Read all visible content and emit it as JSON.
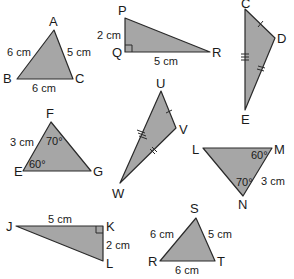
{
  "colors": {
    "fill": "#a6a6a6",
    "stroke": "#2a2a2a",
    "text": "#1a1a1a",
    "background": "#ffffff"
  },
  "triangles": {
    "abc": {
      "vertices": {
        "A": "A",
        "B": "B",
        "C": "C"
      },
      "sides": {
        "ab": "6 cm",
        "ac": "5 cm",
        "bc": "6 cm"
      }
    },
    "pqr": {
      "vertices": {
        "P": "P",
        "Q": "Q",
        "R": "R"
      },
      "sides": {
        "pq": "2 cm",
        "qr": "5 cm"
      },
      "right_angle_at": "Q"
    },
    "cde": {
      "vertices": {
        "C": "C",
        "D": "D",
        "E": "E"
      },
      "tick_marks": {
        "cd": 1,
        "de": 2,
        "ce": 3
      }
    },
    "efg": {
      "vertices": {
        "E": "E",
        "F": "F",
        "G": "G"
      },
      "sides": {
        "ef": "3 cm"
      },
      "angles": {
        "F": "70°",
        "E": "60°"
      }
    },
    "uvw": {
      "vertices": {
        "U": "U",
        "V": "V",
        "W": "W"
      },
      "tick_marks": {
        "uv": 1,
        "vw": 2,
        "uw": 3
      }
    },
    "lmn": {
      "vertices": {
        "L": "L",
        "M": "M",
        "N": "N"
      },
      "sides": {
        "mn": "3 cm"
      },
      "angles": {
        "M": "60°",
        "N": "70°"
      }
    },
    "jkl": {
      "vertices": {
        "J": "J",
        "K": "K",
        "L": "L"
      },
      "sides": {
        "jk": "5 cm",
        "kl": "2 cm"
      },
      "right_angle_at": "K"
    },
    "rst": {
      "vertices": {
        "R": "R",
        "S": "S",
        "T": "T"
      },
      "sides": {
        "rs": "6 cm",
        "st": "5 cm",
        "rt": "6 cm"
      }
    }
  }
}
